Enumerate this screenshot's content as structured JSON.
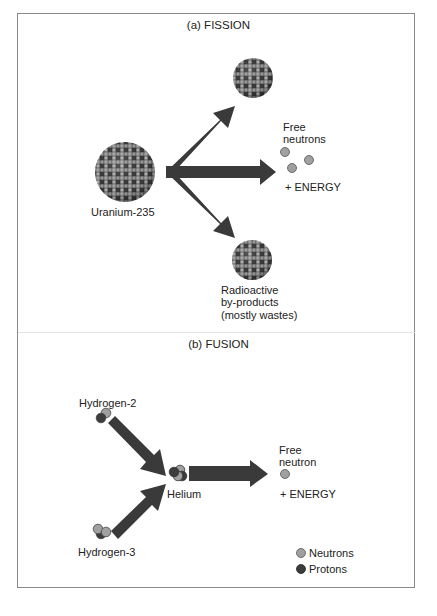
{
  "fission": {
    "title": "(a) FISSION",
    "reactant_label": "Uranium-235",
    "products": {
      "free_neutrons_line1": "Free",
      "free_neutrons_line2": "neutrons",
      "energy": "+ ENERGY",
      "byproducts_line1": "Radioactive",
      "byproducts_line2": "by-products",
      "byproducts_line3": "(mostly wastes)"
    }
  },
  "fusion": {
    "title": "(b) FUSION",
    "reactant1_label": "Hydrogen-2",
    "reactant2_label": "Hydrogen-3",
    "product_label": "Helium",
    "free_neutron_line1": "Free",
    "free_neutron_line2": "neutron",
    "energy": "+ ENERGY"
  },
  "legend": {
    "items": [
      {
        "label": "Neutrons",
        "color": "#a0a0a0"
      },
      {
        "label": "Protons",
        "color": "#3c3c3c"
      }
    ]
  },
  "colors": {
    "arrow": "#3a3a3a",
    "neutron": "#a0a0a0",
    "proton": "#3c3c3c",
    "frame": "#8a8a8a"
  }
}
